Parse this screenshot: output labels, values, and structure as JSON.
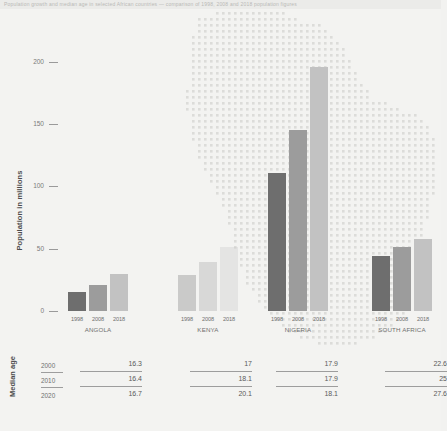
{
  "header": {
    "strip_text": "Population growth and median age in selected African countries — comparison of 1998, 2008 and 2018 population figures"
  },
  "axis": {
    "ylabel": "Population in millions",
    "yticks": [
      "200",
      "150",
      "100",
      "50",
      "0"
    ]
  },
  "median": {
    "row_label": "Median age",
    "years": [
      "2000",
      "2010",
      "2020"
    ]
  },
  "colors": {
    "bar_1998": "#6e6e6e",
    "bar_2008": "#9c9c9c",
    "bar_2018": "#c2c2c2",
    "background": "#f3f3f1",
    "text": "#6f6f6f",
    "map_dot": "#dcdcd9"
  },
  "chart_data": {
    "type": "bar",
    "title": "",
    "xlabel": "",
    "ylabel": "Population in millions",
    "ylim": [
      0,
      210
    ],
    "grid": false,
    "legend": "none",
    "categories": [
      "ANGOLA",
      "KENYA",
      "NIGERIA",
      "SOUTH AFRICA"
    ],
    "sub_categories": [
      "1998",
      "2008",
      "2018"
    ],
    "series": [
      {
        "name": "1998",
        "values": [
          15.0,
          29.0,
          111.0,
          44.0
        ]
      },
      {
        "name": "2008",
        "values": [
          21.0,
          39.0,
          145.0,
          51.0
        ]
      },
      {
        "name": "2018",
        "values": [
          30.0,
          51.0,
          196.0,
          58.0
        ]
      }
    ],
    "median_age_table": {
      "row_label": "Median age",
      "rows": [
        "2000",
        "2010",
        "2020"
      ],
      "columns": [
        "ANGOLA",
        "KENYA",
        "NIGERIA",
        "SOUTH AFRICA"
      ],
      "values": [
        [
          "16.3",
          "17",
          "17.9",
          "22.6"
        ],
        [
          "16.4",
          "18.1",
          "17.9",
          "25"
        ],
        [
          "16.7",
          "20.1",
          "18.1",
          "27.6"
        ]
      ]
    }
  }
}
